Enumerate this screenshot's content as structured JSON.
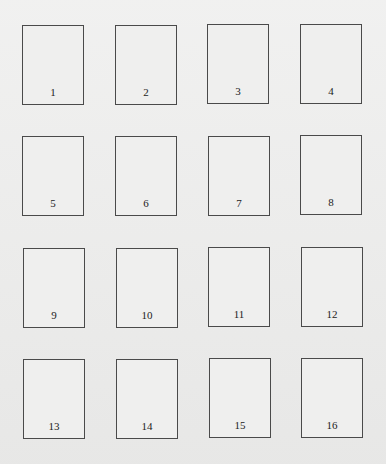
{
  "colors": {
    "background": "#ececeb",
    "box_border": "#4a4a4a",
    "label": "#222222"
  },
  "grid": {
    "rows": 4,
    "cols": 4,
    "boxes": [
      {
        "label": "1",
        "x": 22,
        "y": 25
      },
      {
        "label": "2",
        "x": 115,
        "y": 25
      },
      {
        "label": "3",
        "x": 207,
        "y": 24
      },
      {
        "label": "4",
        "x": 300,
        "y": 24
      },
      {
        "label": "5",
        "x": 22,
        "y": 136
      },
      {
        "label": "6",
        "x": 115,
        "y": 136
      },
      {
        "label": "7",
        "x": 208,
        "y": 136
      },
      {
        "label": "8",
        "x": 300,
        "y": 135
      },
      {
        "label": "9",
        "x": 23,
        "y": 248
      },
      {
        "label": "10",
        "x": 116,
        "y": 248
      },
      {
        "label": "11",
        "x": 208,
        "y": 247
      },
      {
        "label": "12",
        "x": 301,
        "y": 247
      },
      {
        "label": "13",
        "x": 23,
        "y": 359
      },
      {
        "label": "14",
        "x": 116,
        "y": 359
      },
      {
        "label": "15",
        "x": 209,
        "y": 358
      },
      {
        "label": "16",
        "x": 301,
        "y": 358
      }
    ]
  }
}
